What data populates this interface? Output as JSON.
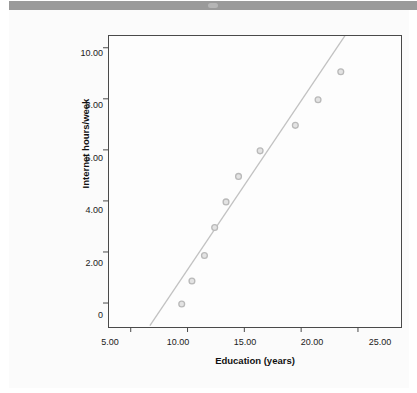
{
  "window": {
    "titlebar_color": "#9a9a9a",
    "background_color": "#fbfbfb"
  },
  "chart_data": {
    "type": "scatter",
    "title": "",
    "subtitle": "",
    "xlabel": "Education (years)",
    "ylabel": "Internet hours/week",
    "xlim": [
      3.0,
      28.7
    ],
    "ylim": [
      -0.9,
      10.5
    ],
    "xticks": [
      5,
      10,
      15,
      20,
      25
    ],
    "xtick_labels": [
      "5.00",
      "10.00",
      "15.00",
      "20.00",
      "25.00"
    ],
    "yticks": [
      0,
      2,
      4,
      6,
      8,
      10
    ],
    "ytick_labels": [
      "0",
      "2.00",
      "4.00",
      "6.00",
      "8.00",
      "10.00"
    ],
    "grid": false,
    "legend": null,
    "marker": {
      "shape": "circle",
      "size": 5,
      "edge_color": "#b9b9b9",
      "fill_color": "#e3e3e3",
      "edge_width": 1.3
    },
    "series": [
      {
        "name": "Observations",
        "type": "scatter",
        "x": [
          9.4,
          10.3,
          11.4,
          12.3,
          13.3,
          14.4,
          16.3,
          19.4,
          21.4,
          23.4
        ],
        "y": [
          0.0,
          0.9,
          1.9,
          3.0,
          4.0,
          5.0,
          6.0,
          7.0,
          8.0,
          9.1
        ]
      },
      {
        "name": "Fit line",
        "type": "line",
        "color": "#c2c2c2",
        "width": 1.3,
        "x": [
          6.6,
          23.9
        ],
        "y": [
          -0.85,
          10.6
        ]
      }
    ],
    "annotations": []
  }
}
